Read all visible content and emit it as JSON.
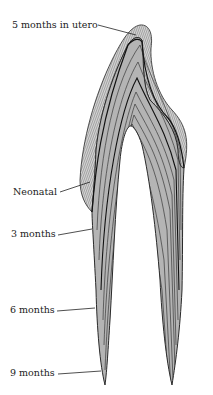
{
  "figure": {
    "labels": [
      {
        "id": "label-5-months-in-utero",
        "text": "5 months in utero"
      },
      {
        "id": "label-neonatal",
        "text": "Neonatal"
      },
      {
        "id": "label-3-months",
        "text": "3 months"
      },
      {
        "id": "label-6-months",
        "text": "6 months"
      },
      {
        "id": "label-9-months",
        "text": "9 months"
      }
    ],
    "colors": {
      "fill": "#b4b4b4",
      "enamel_fill": "#c8c8c8",
      "line": "#2a2a2a",
      "label_text": "#222222"
    }
  }
}
